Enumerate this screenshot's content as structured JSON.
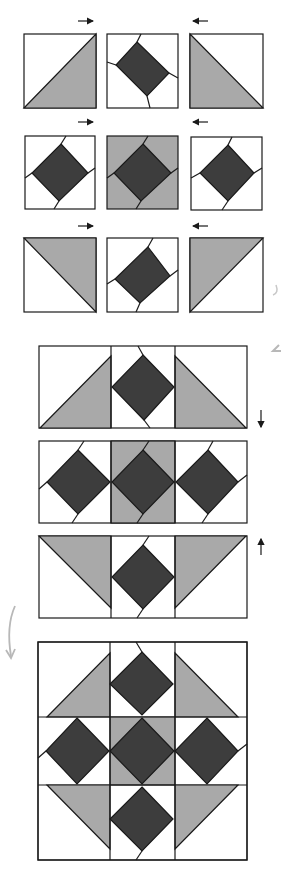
{
  "diagram": {
    "type": "quilt-block-assembly",
    "colors": {
      "background": "#ffffff",
      "light_fabric": "#a9a9a9",
      "dark_fabric": "#3d3d3d",
      "outline": "#1a1a1a",
      "annotation_gray": "#b8b8b8"
    },
    "step1_units": {
      "rows": [
        {
          "row": 1,
          "units": [
            "hst-light-bottom-right",
            "square-in-square-white",
            "hst-light-bottom-left"
          ],
          "press_arrows": [
            "right",
            "left"
          ]
        },
        {
          "row": 2,
          "units": [
            "square-in-square-white",
            "square-in-square-gray",
            "square-in-square-white"
          ],
          "press_arrows": [
            "right",
            "left"
          ]
        },
        {
          "row": 3,
          "units": [
            "hst-light-top-right",
            "square-in-square-white",
            "hst-light-top-left"
          ],
          "press_arrows": [
            "right",
            "left"
          ]
        }
      ]
    },
    "step2_rows": {
      "rows": [
        {
          "row": 1,
          "press_arrow": "down"
        },
        {
          "row": 2,
          "press_arrow": null
        },
        {
          "row": 3,
          "press_arrow": "up"
        }
      ]
    },
    "step3_block": {
      "label": "completed-block"
    },
    "footer_caption": ""
  }
}
